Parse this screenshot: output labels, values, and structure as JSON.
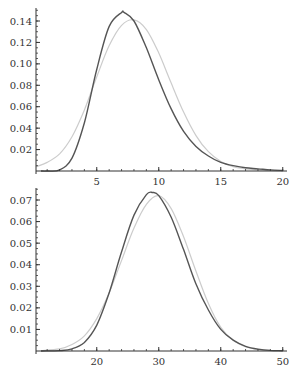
{
  "chart_data": [
    {
      "type": "line",
      "title": "",
      "xlabel": "",
      "ylabel": "",
      "xlim": [
        0.1,
        20
      ],
      "ylim": [
        0,
        0.15
      ],
      "grid": false,
      "legend": null,
      "x_ticks": [
        5,
        10,
        15,
        20
      ],
      "y_ticks": [
        0.02,
        0.04,
        0.06,
        0.08,
        0.1,
        0.12,
        0.14
      ],
      "y_tick_labels": [
        "0.02",
        "0.04",
        "0.06",
        "0.08",
        "0.10",
        "0.12",
        "0.14"
      ],
      "series": [
        {
          "name": "dark curve",
          "color": "#555555",
          "x": [
            0.5,
            1,
            2,
            3,
            4,
            5,
            6,
            7,
            7.2,
            8,
            9,
            10,
            11,
            12,
            13,
            14,
            15,
            16,
            17,
            18,
            19,
            20
          ],
          "y": [
            0.0,
            0.0,
            0.001,
            0.012,
            0.045,
            0.095,
            0.135,
            0.148,
            0.148,
            0.14,
            0.115,
            0.085,
            0.058,
            0.037,
            0.023,
            0.014,
            0.008,
            0.005,
            0.003,
            0.002,
            0.001,
            0.0005
          ]
        },
        {
          "name": "light curve",
          "color": "#cccccc",
          "x": [
            0.1,
            1,
            2,
            3,
            4,
            5,
            6,
            7,
            8,
            9,
            10,
            11,
            12,
            13,
            14,
            15,
            16,
            17,
            18,
            19,
            20
          ],
          "y": [
            0.004,
            0.008,
            0.016,
            0.032,
            0.057,
            0.088,
            0.117,
            0.136,
            0.141,
            0.132,
            0.11,
            0.082,
            0.055,
            0.033,
            0.018,
            0.009,
            0.004,
            0.002,
            0.001,
            0.0005,
            0.0002
          ]
        }
      ]
    },
    {
      "type": "line",
      "title": "",
      "xlabel": "",
      "ylabel": "",
      "xlim": [
        10.2,
        50
      ],
      "ylim": [
        0,
        0.075
      ],
      "grid": false,
      "legend": null,
      "x_ticks": [
        20,
        30,
        40,
        50
      ],
      "y_ticks": [
        0.01,
        0.02,
        0.03,
        0.04,
        0.05,
        0.06,
        0.07
      ],
      "y_tick_labels": [
        "0.01",
        "0.02",
        "0.03",
        "0.04",
        "0.05",
        "0.06",
        "0.07"
      ],
      "series": [
        {
          "name": "dark curve",
          "color": "#555555",
          "x": [
            11,
            14,
            16,
            18,
            20,
            22,
            24,
            26,
            28,
            29,
            30,
            32,
            34,
            36,
            38,
            40,
            42,
            44,
            46,
            48,
            50
          ],
          "y": [
            0.0,
            0.0002,
            0.001,
            0.004,
            0.012,
            0.027,
            0.046,
            0.063,
            0.0725,
            0.0735,
            0.072,
            0.062,
            0.047,
            0.031,
            0.019,
            0.01,
            0.005,
            0.0022,
            0.0009,
            0.0003,
            0.0001
          ]
        },
        {
          "name": "light curve",
          "color": "#cccccc",
          "x": [
            11,
            14,
            16,
            18,
            20,
            22,
            24,
            26,
            28,
            30,
            32,
            34,
            36,
            38,
            40,
            42,
            44,
            46,
            48,
            50
          ],
          "y": [
            0.0002,
            0.001,
            0.003,
            0.007,
            0.015,
            0.027,
            0.042,
            0.057,
            0.068,
            0.072,
            0.066,
            0.053,
            0.037,
            0.022,
            0.011,
            0.005,
            0.002,
            0.0007,
            0.0002,
            0.0001
          ]
        }
      ]
    }
  ],
  "layout": {
    "panels": [
      {
        "x_axis_px": 36,
        "x_left_value": 0.1,
        "px_per_x": 12.4,
        "baseline_px": 171,
        "px_per_y": 1071.4,
        "axis_right_px": 287,
        "axis_top_px": 8,
        "minor_x_step": 1,
        "minor_y_step": 0.005
      },
      {
        "x_axis_px": 36,
        "x_left_value": 10.2,
        "px_per_x": 6.2,
        "baseline_px": 351,
        "px_per_y": 2157,
        "axis_right_px": 287,
        "axis_top_px": 188,
        "minor_x_step": 2,
        "minor_y_step": 0.0025
      }
    ]
  }
}
